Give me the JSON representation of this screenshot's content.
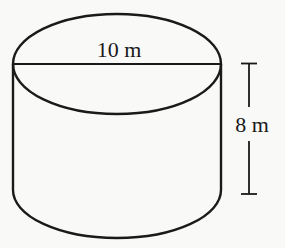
{
  "diagram": {
    "type": "cylinder",
    "colors": {
      "background": "#f9f9f8",
      "stroke": "#1a1a1a"
    },
    "labels": {
      "diameter": "10 m",
      "height": "8 m"
    },
    "measurements": {
      "diameter": {
        "value": 10,
        "unit": "m"
      },
      "height": {
        "value": 8,
        "unit": "m"
      }
    }
  }
}
